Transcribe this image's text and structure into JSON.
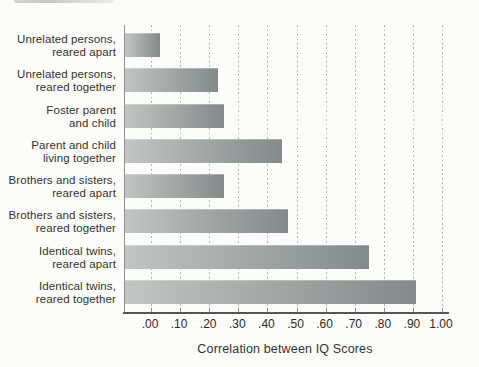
{
  "chart_data": {
    "type": "bar",
    "orientation": "horizontal",
    "title": "",
    "xlabel": "Correlation between IQ Scores",
    "ylabel": "",
    "categories": [
      {
        "line1": "Unrelated persons,",
        "line2": "reared apart"
      },
      {
        "line1": "Unrelated persons,",
        "line2": "reared together"
      },
      {
        "line1": "Foster parent",
        "line2": "and child"
      },
      {
        "line1": "Parent and child",
        "line2": "living together"
      },
      {
        "line1": "Brothers and sisters,",
        "line2": "reared apart"
      },
      {
        "line1": "Brothers and sisters,",
        "line2": "reared together"
      },
      {
        "line1": "Identical twins,",
        "line2": "reared apart"
      },
      {
        "line1": "Identical twins,",
        "line2": "reared together"
      }
    ],
    "values": [
      0.03,
      0.23,
      0.25,
      0.45,
      0.25,
      0.47,
      0.75,
      0.91
    ],
    "xtick_labels": [
      ".00",
      ".10",
      ".20",
      ".30",
      ".40",
      ".50",
      ".60",
      ".70",
      ".80",
      ".90",
      "1.00"
    ],
    "xlim": [
      0,
      1.0
    ],
    "grid": "vertical-dotted",
    "legend": "none",
    "bar_gradient": {
      "start": "#c1c5c4",
      "end": "#848a8a"
    },
    "colors": {
      "gridline": "#b4b4b2",
      "axis_line": "#555553",
      "y_axis_line": "#8f8f8f",
      "text": "#333331",
      "background": "#fcfcfa"
    }
  }
}
